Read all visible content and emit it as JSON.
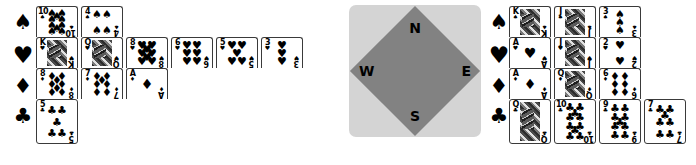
{
  "diagram": {
    "type": "bridge-hand-diagram",
    "suit_glyphs": {
      "S": "♠",
      "H": "♥",
      "D": "♦",
      "C": "♣"
    },
    "suit_order": [
      "S",
      "H",
      "D",
      "C"
    ],
    "suit_names": {
      "S": "spades",
      "H": "hearts",
      "D": "diamonds",
      "C": "clubs"
    }
  },
  "compass": {
    "north_label": "N",
    "south_label": "S",
    "west_label": "W",
    "east_label": "E",
    "outer_color": "#d4d4d4",
    "inner_color": "#828282"
  },
  "hands": {
    "west": {
      "seat": "West",
      "suits": {
        "S": [
          "10",
          "4"
        ],
        "H": [
          "K",
          "Q",
          "8",
          "6",
          "5",
          "3"
        ],
        "D": [
          "8",
          "7",
          "A"
        ],
        "C": [
          "5"
        ]
      }
    },
    "east": {
      "seat": "East",
      "suits": {
        "S": [
          "K",
          "J",
          "3"
        ],
        "H": [
          "A",
          "J",
          "2"
        ],
        "D": [
          "A",
          "Q",
          "6"
        ],
        "C": [
          "Q",
          "10",
          "9",
          "7"
        ]
      }
    }
  },
  "card_pip_layouts": {
    "A": [
      [
        50,
        50
      ]
    ],
    "2": [
      [
        50,
        20
      ],
      [
        50,
        80
      ]
    ],
    "3": [
      [
        50,
        20
      ],
      [
        50,
        50
      ],
      [
        50,
        80
      ]
    ],
    "4": [
      [
        25,
        20
      ],
      [
        75,
        20
      ],
      [
        25,
        80
      ],
      [
        75,
        80
      ]
    ],
    "5": [
      [
        25,
        20
      ],
      [
        75,
        20
      ],
      [
        50,
        50
      ],
      [
        25,
        80
      ],
      [
        75,
        80
      ]
    ],
    "6": [
      [
        25,
        20
      ],
      [
        75,
        20
      ],
      [
        25,
        50
      ],
      [
        75,
        50
      ],
      [
        25,
        80
      ],
      [
        75,
        80
      ]
    ],
    "7": [
      [
        25,
        18
      ],
      [
        75,
        18
      ],
      [
        50,
        34
      ],
      [
        25,
        50
      ],
      [
        75,
        50
      ],
      [
        25,
        82
      ],
      [
        75,
        82
      ]
    ],
    "8": [
      [
        25,
        18
      ],
      [
        75,
        18
      ],
      [
        50,
        34
      ],
      [
        25,
        50
      ],
      [
        75,
        50
      ],
      [
        50,
        66
      ],
      [
        25,
        82
      ],
      [
        75,
        82
      ]
    ],
    "9": [
      [
        25,
        16
      ],
      [
        75,
        16
      ],
      [
        25,
        38
      ],
      [
        75,
        38
      ],
      [
        50,
        50
      ],
      [
        25,
        62
      ],
      [
        75,
        62
      ],
      [
        25,
        84
      ],
      [
        75,
        84
      ]
    ],
    "10": [
      [
        25,
        14
      ],
      [
        75,
        14
      ],
      [
        50,
        28
      ],
      [
        25,
        38
      ],
      [
        75,
        38
      ],
      [
        25,
        62
      ],
      [
        75,
        62
      ],
      [
        50,
        72
      ],
      [
        25,
        86
      ],
      [
        75,
        86
      ]
    ]
  },
  "court_ranks": [
    "J",
    "Q",
    "K"
  ]
}
